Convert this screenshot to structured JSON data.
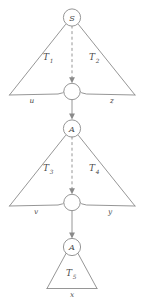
{
  "figure": {
    "background_color": "#ffffff",
    "stroke_color": "#8a8a8a",
    "text_color": "#4a4a4a",
    "width": 144,
    "height": 305
  },
  "nodes": [
    {
      "id": "root",
      "label": "S",
      "kind": "labeled-circle"
    },
    {
      "id": "junction1",
      "label": "",
      "kind": "empty-circle"
    },
    {
      "id": "midA",
      "label": "A",
      "kind": "labeled-circle"
    },
    {
      "id": "junction2",
      "label": "",
      "kind": "empty-circle"
    },
    {
      "id": "lowA",
      "label": "A",
      "kind": "labeled-circle"
    }
  ],
  "subtrees": [
    {
      "id": "T1",
      "base": "T",
      "sub": "1",
      "side": "left"
    },
    {
      "id": "T2",
      "base": "T",
      "sub": "2",
      "side": "right"
    },
    {
      "id": "T3",
      "base": "T",
      "sub": "3",
      "side": "left"
    },
    {
      "id": "T4",
      "base": "T",
      "sub": "4",
      "side": "right"
    },
    {
      "id": "T5",
      "base": "T",
      "sub": "5",
      "side": "center"
    }
  ],
  "leaves": [
    {
      "id": "leaf-u",
      "label": "u",
      "level": 1,
      "side": "left"
    },
    {
      "id": "leaf-z",
      "label": "z",
      "level": 1,
      "side": "right"
    },
    {
      "id": "leaf-v",
      "label": "v",
      "level": 2,
      "side": "left"
    },
    {
      "id": "leaf-y",
      "label": "y",
      "level": 2,
      "side": "right"
    },
    {
      "id": "leaf-x",
      "label": "x",
      "level": 3,
      "side": "center"
    }
  ],
  "connectors": [
    {
      "id": "dashed-root-to-junction1",
      "style": "dashed",
      "arrow": true
    },
    {
      "id": "solid-junction1-to-midA",
      "style": "solid",
      "arrow": true
    },
    {
      "id": "dashed-midA-to-junction2",
      "style": "dashed",
      "arrow": true
    },
    {
      "id": "solid-junction2-to-lowA",
      "style": "solid",
      "arrow": true
    }
  ]
}
